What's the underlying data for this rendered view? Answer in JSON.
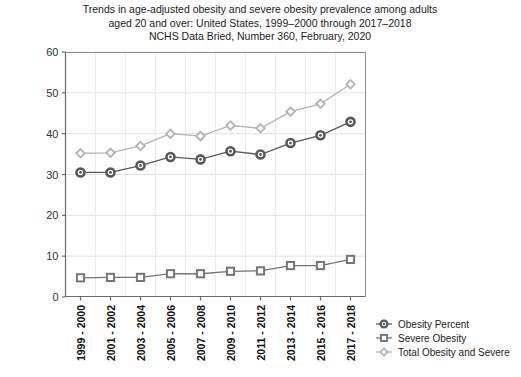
{
  "chart_data": {
    "type": "line",
    "title": "Trends in age-adjusted obesity and severe obesity prevalence among adults aged 20 and over: United States, 1999–2000 through 2017–2018",
    "title_lines": [
      "Trends in age-adjusted obesity and severe obesity prevalence among adults",
      "aged 20 and over: United States, 1999–2000 through 2017–2018",
      "NCHS Data Bried, Number 360, February, 2020"
    ],
    "subtitle": "NCHS Data Bried, Number 360, February, 2020",
    "xlabel": "",
    "ylabel": "",
    "ylim": [
      0,
      60
    ],
    "ytick_values": [
      0,
      10,
      20,
      30,
      40,
      50,
      60
    ],
    "ytick_labels": [
      "0",
      "10",
      "20",
      "30",
      "40",
      "50",
      "60"
    ],
    "grid": true,
    "legend_position": "right-bottom",
    "categories": [
      "1999 - 2000",
      "2001 - 2002",
      "2003 - 2004",
      "2005 - 2006",
      "2007 - 2008",
      "2009 - 2010",
      "2011 - 2012",
      "2013 - 2014",
      "2015 - 2016",
      "2017 - 2018"
    ],
    "series": [
      {
        "name": "Obesity Percent",
        "color": "#595959",
        "marker": "circle",
        "values": [
          30.5,
          30.5,
          32.2,
          34.3,
          33.7,
          35.7,
          34.9,
          37.7,
          39.6,
          42.9
        ]
      },
      {
        "name": "Severe Obesity",
        "color": "#767676",
        "marker": "square",
        "values": [
          4.7,
          4.8,
          4.8,
          5.7,
          5.7,
          6.3,
          6.4,
          7.7,
          7.7,
          9.2
        ]
      },
      {
        "name": "Total Obesity and Severe",
        "color": "#b3b3b3",
        "marker": "diamond",
        "values": [
          35.2,
          35.3,
          37.0,
          40.0,
          39.4,
          42.0,
          41.3,
          45.4,
          47.3,
          52.1
        ]
      }
    ]
  },
  "legend": {
    "items": [
      {
        "label": "Obesity Percent"
      },
      {
        "label": "Severe Obesity"
      },
      {
        "label": "Total Obesity and Severe"
      }
    ]
  }
}
